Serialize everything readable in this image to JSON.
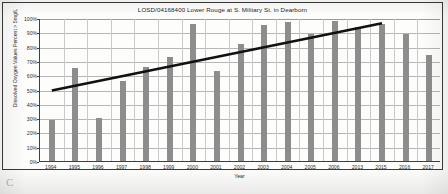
{
  "figure": {
    "border_color": "#3a3a3a",
    "background": "#fdfdfc",
    "page_mark": "C"
  },
  "chart_data": {
    "type": "bar",
    "title": "LOSD/04168400 Lower Rouge at S. Military St. in Dearborn",
    "xlabel": "Year",
    "ylabel": "Dissolved Oxygen Values Percent > 5mg/L",
    "categories": [
      "1994",
      "1995",
      "1996",
      "1997",
      "1998",
      "1999",
      "2000",
      "2001",
      "2002",
      "2003",
      "2004",
      "2005",
      "2006",
      "2013",
      "2015",
      "2016",
      "2017"
    ],
    "values": [
      29,
      65,
      30,
      56,
      66,
      73,
      96,
      63,
      82,
      95,
      97,
      89,
      98,
      94,
      96,
      89,
      74
    ],
    "bar_color": "#8d8d8d",
    "ylim": [
      0,
      100
    ],
    "yticks": [
      0,
      10,
      20,
      30,
      40,
      50,
      60,
      70,
      80,
      90,
      100
    ],
    "ytick_labels": [
      "0%",
      "10%",
      "20%",
      "30%",
      "40%",
      "50%",
      "60%",
      "70%",
      "80%",
      "90%",
      "100%"
    ],
    "grid": true,
    "legend": false,
    "series": [
      {
        "name": "Dissolved Oxygen Values Percent > 5mg/L",
        "type": "bar",
        "values": [
          29,
          65,
          30,
          56,
          66,
          73,
          96,
          63,
          82,
          95,
          97,
          89,
          98,
          94,
          96,
          89,
          74
        ]
      },
      {
        "name": "Linear trend",
        "type": "line",
        "color": "#111111",
        "x_start": "1994",
        "x_end": "2015",
        "y_start": 50,
        "y_end": 97
      }
    ],
    "annotations": []
  }
}
